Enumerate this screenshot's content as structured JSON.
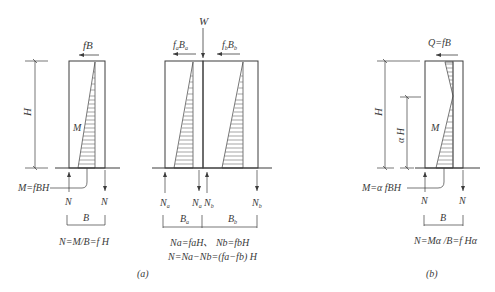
{
  "figure": {
    "panel_a_label": "(a)",
    "panel_b_label": "(b)"
  },
  "left_wall": {
    "force_top": "fB",
    "height_label": "H",
    "moment_label": "M",
    "moment_callout": "M=fBH",
    "reaction_left": "N",
    "reaction_right": "N",
    "width_label": "B",
    "equation": "N=M/B=f H"
  },
  "double_wall": {
    "load_top": "W",
    "force_a": "f",
    "force_a_sub": "a",
    "force_a_B": "B",
    "force_a_B_sub": "a",
    "force_b": "f",
    "force_b_sub": "b",
    "force_b_B": "B",
    "force_b_B_sub": "b",
    "reactions": [
      {
        "main": "N",
        "sub": "a"
      },
      {
        "main": "N",
        "sub": "a"
      },
      {
        "main": "N",
        "sub": "b"
      },
      {
        "main": "N",
        "sub": "b"
      }
    ],
    "width_a": {
      "main": "B",
      "sub": "a"
    },
    "width_b": {
      "main": "B",
      "sub": "b"
    },
    "equation_1": "Na=faH、 Nb=fbH",
    "equation_2": "N=Na−Nb=(fa−fb) H"
  },
  "right_wall": {
    "force_top": "Q=fB",
    "height_label": "H",
    "partial_height_label": "α H",
    "moment_label": "M",
    "moment_callout": "M=α fBH",
    "reaction_left": "N",
    "reaction_right": "N",
    "width_label": "B",
    "equation": "N=Mα /B=f Hα"
  }
}
